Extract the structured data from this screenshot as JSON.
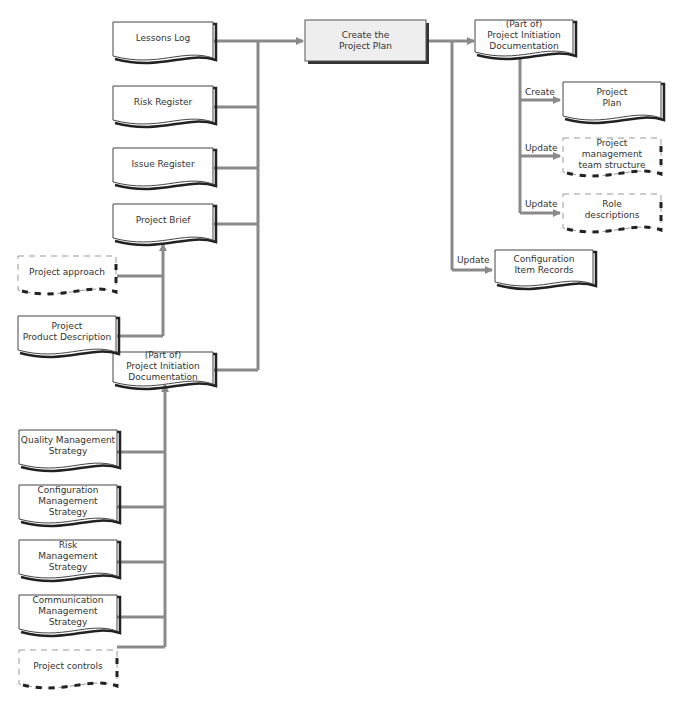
{
  "process": {
    "label": "Create the\nProject Plan",
    "fill": "#eeeeee"
  },
  "colors": {
    "connector": "#8a8a8a",
    "border": "#222222",
    "dashed": "#999999",
    "shadow": "#333333"
  },
  "inputs": [
    {
      "id": "lessons-log",
      "label": "Lessons Log"
    },
    {
      "id": "risk-register",
      "label": "Risk Register"
    },
    {
      "id": "issue-register",
      "label": "Issue Register"
    },
    {
      "id": "project-brief",
      "label": "Project Brief"
    },
    {
      "id": "pid-input",
      "label": "(Part of)\nProject Initiation\nDocumentation"
    }
  ],
  "brief_inputs": [
    {
      "id": "project-approach",
      "label": "Project approach",
      "dashed": true
    },
    {
      "id": "project-product-description",
      "label": "Project\nProduct Description",
      "dashed": false
    }
  ],
  "pid_inputs": [
    {
      "id": "quality-management-strategy",
      "label": "Quality Management\nStrategy",
      "dashed": false
    },
    {
      "id": "configuration-management-strategy",
      "label": "Configuration\nManagement\nStrategy",
      "dashed": false
    },
    {
      "id": "risk-management-strategy",
      "label": "Risk\nManagement\nStrategy",
      "dashed": false
    },
    {
      "id": "communication-management-strategy",
      "label": "Communication\nManagement\nStrategy",
      "dashed": false
    },
    {
      "id": "project-controls",
      "label": "Project controls",
      "dashed": true
    }
  ],
  "outputs": {
    "pid": {
      "label": "(Part of)\nProject Initiation\nDocumentation"
    },
    "pid_children": [
      {
        "id": "project-plan",
        "action": "Create",
        "label": "Project\nPlan",
        "dashed": false
      },
      {
        "id": "project-management-team-structure",
        "action": "Update",
        "label": "Project\nmanagement\nteam structure",
        "dashed": true
      },
      {
        "id": "role-descriptions",
        "action": "Update",
        "label": "Role\ndescriptions",
        "dashed": true
      }
    ],
    "config_item_records": {
      "action": "Update",
      "label": "Configuration\nItem Records"
    }
  }
}
